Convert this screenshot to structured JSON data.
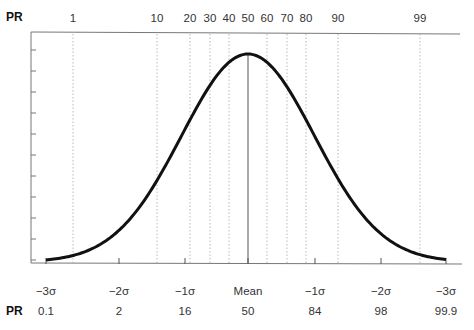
{
  "chart_data": {
    "type": "line",
    "xlabel": "",
    "ylabel": "",
    "top_axis": {
      "label": "PR",
      "ticks": [
        {
          "pr": "1",
          "x": 73
        },
        {
          "pr": "10",
          "x": 157
        },
        {
          "pr": "20",
          "x": 190
        },
        {
          "pr": "30",
          "x": 210
        },
        {
          "pr": "40",
          "x": 229
        },
        {
          "pr": "50",
          "x": 248
        },
        {
          "pr": "60",
          "x": 267
        },
        {
          "pr": "70",
          "x": 287
        },
        {
          "pr": "80",
          "x": 306
        },
        {
          "pr": "90",
          "x": 338
        },
        {
          "pr": "99",
          "x": 420
        }
      ]
    },
    "bottom_axis": {
      "sigma_labels": [
        "−3σ",
        "−2σ",
        "−1σ",
        "Mean",
        "−1σ",
        "−2σ",
        "−3σ"
      ],
      "sigma_x": [
        46,
        119,
        185,
        248,
        315,
        381,
        446
      ],
      "pr_label": "PR",
      "pr_values": [
        "0.1",
        "2",
        "16",
        "50",
        "84",
        "98",
        "99.9"
      ]
    },
    "series": [
      {
        "name": "Normal distribution",
        "x": [
          -3,
          -2,
          -1,
          0,
          1,
          2,
          3
        ],
        "values": [
          0.004,
          0.054,
          0.242,
          0.399,
          0.242,
          0.054,
          0.004
        ]
      }
    ],
    "y_ticks_count": 11,
    "mean_line": true,
    "grid": "dotted vertical percentile lines"
  },
  "labels": {
    "top_pr": "PR",
    "bottom_pr": "PR"
  }
}
